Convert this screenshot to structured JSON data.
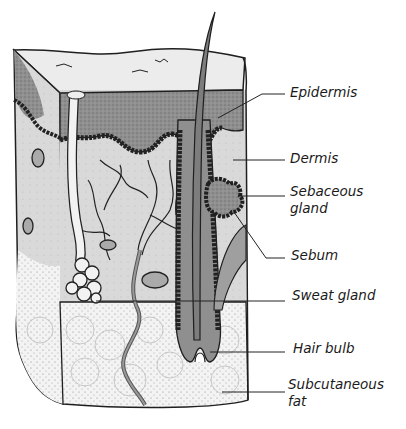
{
  "diagram": {
    "type": "anatomical cross-section",
    "labels": [
      {
        "id": "epidermis",
        "text": "Epidermis"
      },
      {
        "id": "dermis",
        "text": "Dermis"
      },
      {
        "id": "sebaceous-gland",
        "line1": "Sebaceous",
        "line2": "gland"
      },
      {
        "id": "sebum",
        "text": "Sebum"
      },
      {
        "id": "sweat-gland",
        "text": "Sweat gland"
      },
      {
        "id": "hair-bulb",
        "text": "Hair bulb"
      },
      {
        "id": "subcutaneous-fat",
        "line1": "Subcutaneous",
        "line2": "fat"
      }
    ],
    "colors": {
      "outline": "#1f1f1f",
      "epidermis_fill": "#9a9a9a",
      "dermis_fill": "#d8d8d8",
      "fat_fill": "#f4f4f4",
      "surface_fill": "#ececec",
      "hair_fill": "#8c8c8c"
    }
  }
}
